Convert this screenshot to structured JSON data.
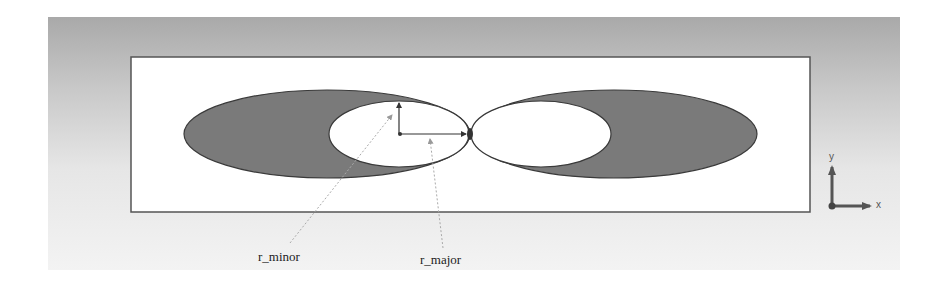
{
  "diagram": {
    "type": "geometry-schematic",
    "colors": {
      "backdrop_top": "#a9a9a9",
      "backdrop_bottom": "#f3f3f3",
      "domain_fill": "#ffffff",
      "domain_border": "#555555",
      "shell_fill": "#7a7a7a",
      "shell_stroke": "#3a3a3a",
      "inner_fill": "#ffffff",
      "dimension_arrow": "#333333",
      "leader_line": "#999999",
      "triad": "#555555"
    },
    "annotations": {
      "r_minor": "r_minor",
      "r_major": "r_major"
    },
    "triad": {
      "x_label": "x",
      "y_label": "y"
    }
  }
}
